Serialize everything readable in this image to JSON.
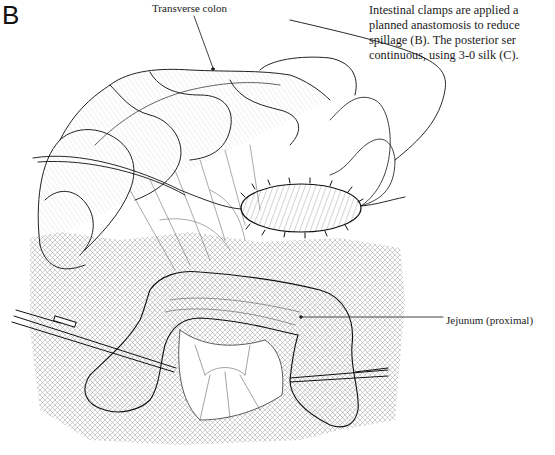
{
  "figure": {
    "panel_letter": "B",
    "labels": {
      "transverse_colon": "Transverse colon",
      "jejunum": "Jejunum (proximal)"
    },
    "caption_lines": [
      "Intestinal clamps are applied a",
      "planned anastomosis to reduce",
      "spillage (B). The posterior ser",
      "continuous, using 3-0 silk (C)."
    ]
  }
}
